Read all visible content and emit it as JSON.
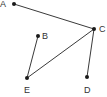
{
  "diagram": {
    "type": "graph",
    "colors": {
      "edge": "#3a3a3a",
      "node": "#1a1a1a",
      "label": "#333333",
      "background": "#ffffff"
    },
    "nodes": [
      {
        "id": "A",
        "label": "A",
        "x": 14,
        "y": 4,
        "lx": 0,
        "ly": 7
      },
      {
        "id": "B",
        "label": "B",
        "x": 38,
        "y": 36,
        "lx": 42,
        "ly": 39
      },
      {
        "id": "C",
        "label": "C",
        "x": 94,
        "y": 29,
        "lx": 99,
        "ly": 32
      },
      {
        "id": "D",
        "label": "D",
        "x": 87,
        "y": 77,
        "lx": 84,
        "ly": 93
      },
      {
        "id": "E",
        "label": "E",
        "x": 27,
        "y": 78,
        "lx": 24,
        "ly": 93
      }
    ],
    "edges": [
      {
        "from": "A",
        "to": "C"
      },
      {
        "from": "C",
        "to": "E"
      },
      {
        "from": "C",
        "to": "D"
      },
      {
        "from": "B",
        "to": "E"
      }
    ]
  }
}
